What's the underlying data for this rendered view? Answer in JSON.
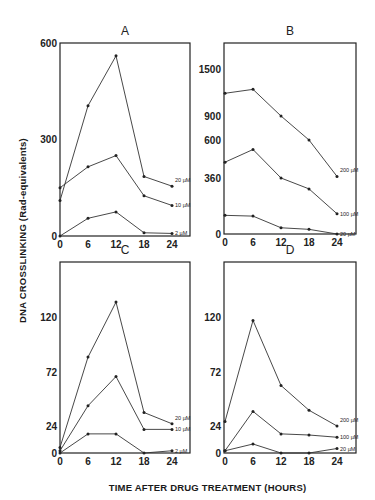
{
  "figure": {
    "ylabel": "DNA CROSSLINKING (Rad-equivalents)",
    "xlabel": "TIME AFTER DRUG TREATMENT (HOURS)"
  },
  "chart_data": [
    {
      "type": "line",
      "panel": "A",
      "title": "A",
      "xlabel": "TIME AFTER DRUG TREATMENT (HOURS)",
      "ylabel": "DNA CROSSLINKING (Rad-equivalents)",
      "x": [
        0,
        6,
        12,
        18,
        24
      ],
      "xticks": [
        "0",
        "6",
        "12",
        "18",
        "24"
      ],
      "yticks": [
        "0",
        "300",
        "600"
      ],
      "ylim": [
        0,
        600
      ],
      "grid": false,
      "series": [
        {
          "name": "20 µM",
          "values": [
            110,
            405,
            560,
            185,
            155
          ]
        },
        {
          "name": "10 µM",
          "values": [
            150,
            215,
            250,
            125,
            95
          ]
        },
        {
          "name": "2 µM",
          "values": [
            0,
            55,
            75,
            10,
            8
          ]
        }
      ]
    },
    {
      "type": "line",
      "panel": "B",
      "title": "B",
      "xlabel": "TIME AFTER DRUG TREATMENT (HOURS)",
      "ylabel": "DNA CROSSLINKING (Rad-equivalents)",
      "x": [
        0,
        6,
        12,
        18,
        24
      ],
      "xticks": [
        "0",
        "6",
        "12",
        "18",
        "24"
      ],
      "yticks": [
        "0",
        "360",
        "600",
        "900",
        "1500"
      ],
      "ylim": [
        0,
        1800
      ],
      "grid": false,
      "series": [
        {
          "name": "200 µM",
          "values": [
            1190,
            1240,
            900,
            600,
            370
          ]
        },
        {
          "name": "100 µM",
          "values": [
            460,
            540,
            360,
            290,
            130
          ]
        },
        {
          "name": "20 µM",
          "values": [
            120,
            115,
            40,
            30,
            0
          ]
        }
      ]
    },
    {
      "type": "line",
      "panel": "C",
      "title": "C",
      "xlabel": "TIME AFTER DRUG TREATMENT (HOURS)",
      "ylabel": "DNA CROSSLINKING (Rad-equivalents)",
      "x": [
        0,
        6,
        12,
        18,
        24
      ],
      "xticks": [
        "0",
        "6",
        "12",
        "18",
        "24"
      ],
      "yticks": [
        "0",
        "24",
        "72",
        "120"
      ],
      "ylim": [
        0,
        168
      ],
      "grid": false,
      "series": [
        {
          "name": "20 µM",
          "values": [
            5,
            85,
            133,
            36,
            26
          ]
        },
        {
          "name": "10 µM",
          "values": [
            2,
            42,
            68,
            21,
            21
          ]
        },
        {
          "name": "2 µM",
          "values": [
            0,
            17,
            17,
            0,
            2
          ]
        }
      ]
    },
    {
      "type": "line",
      "panel": "D",
      "title": "D",
      "xlabel": "TIME AFTER DRUG TREATMENT (HOURS)",
      "ylabel": "DNA CROSSLINKING (Rad-equivalents)",
      "x": [
        0,
        6,
        12,
        18,
        24
      ],
      "xticks": [
        "0",
        "6",
        "12",
        "18",
        "24"
      ],
      "yticks": [
        "0",
        "24",
        "72",
        "120"
      ],
      "ylim": [
        0,
        168
      ],
      "grid": false,
      "series": [
        {
          "name": "200 µM",
          "values": [
            28,
            117,
            60,
            38,
            24
          ]
        },
        {
          "name": "100 µM",
          "values": [
            2,
            37,
            17,
            16,
            14
          ]
        },
        {
          "name": "20 µM",
          "values": [
            2,
            8,
            0,
            0,
            4
          ]
        }
      ]
    }
  ]
}
